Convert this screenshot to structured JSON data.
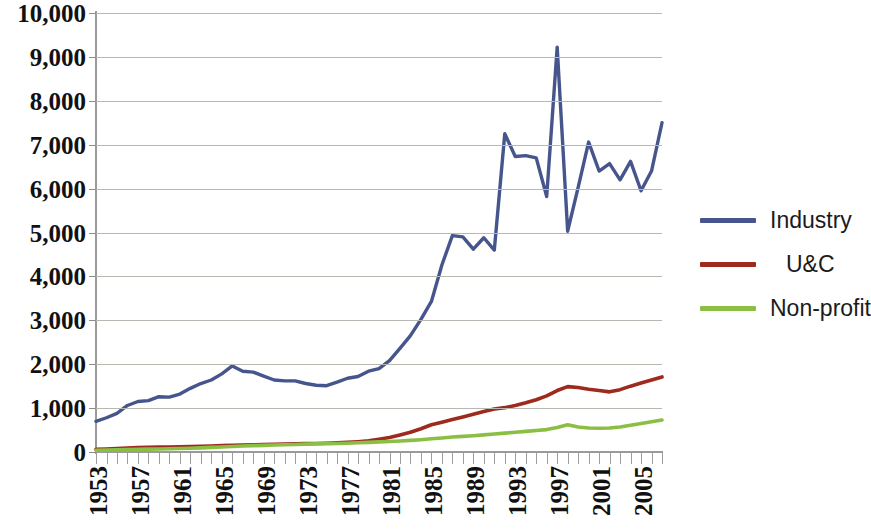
{
  "chart_data": {
    "type": "line",
    "title": "",
    "xlabel": "",
    "ylabel": "",
    "ylim": [
      0,
      10000
    ],
    "xlim": [
      1953,
      2007
    ],
    "grid": true,
    "legend_position": "right",
    "y_ticks": [
      10000,
      9000,
      8000,
      7000,
      6000,
      5000,
      4000,
      3000,
      2000,
      1000,
      0
    ],
    "y_tick_labels": [
      "10,000",
      "9,000",
      "8,000",
      "7,000",
      "6,000",
      "5,000",
      "4,000",
      "3,000",
      "2,000",
      "1,000",
      "0"
    ],
    "x_tick_labels": [
      "1953",
      "1957",
      "1961",
      "1965",
      "1969",
      "1973",
      "1977",
      "1981",
      "1985",
      "1989",
      "1993",
      "1997",
      "2001",
      "2005"
    ],
    "x": [
      1953,
      1954,
      1955,
      1956,
      1957,
      1958,
      1959,
      1960,
      1961,
      1962,
      1963,
      1964,
      1965,
      1966,
      1967,
      1968,
      1969,
      1970,
      1971,
      1972,
      1973,
      1974,
      1975,
      1976,
      1977,
      1978,
      1979,
      1980,
      1981,
      1982,
      1983,
      1984,
      1985,
      1986,
      1987,
      1988,
      1989,
      1990,
      1991,
      1992,
      1993,
      1994,
      1995,
      1996,
      1997,
      1998,
      1999,
      2000,
      2001,
      2002,
      2003,
      2004,
      2005,
      2006,
      2007
    ],
    "series": [
      {
        "name": "Industry",
        "color": "#46558c",
        "values": [
          700,
          780,
          880,
          1060,
          1150,
          1170,
          1260,
          1250,
          1320,
          1450,
          1560,
          1640,
          1780,
          1960,
          1840,
          1820,
          1730,
          1640,
          1620,
          1620,
          1560,
          1520,
          1510,
          1590,
          1680,
          1720,
          1840,
          1900,
          2080,
          2360,
          2650,
          3020,
          3430,
          4260,
          4930,
          4900,
          4620,
          4880,
          4600,
          7250,
          6730,
          6750,
          6700,
          5820,
          9220,
          5030,
          6030,
          7060,
          6400,
          6570,
          6200,
          6620,
          5950,
          6400,
          7500
        ]
      },
      {
        "name": "U&C",
        "color": "#9e2a1e",
        "values": [
          60,
          70,
          80,
          90,
          100,
          105,
          110,
          115,
          120,
          125,
          130,
          135,
          145,
          155,
          160,
          165,
          170,
          175,
          180,
          185,
          190,
          195,
          200,
          210,
          220,
          235,
          255,
          290,
          330,
          390,
          450,
          530,
          620,
          680,
          740,
          800,
          860,
          920,
          980,
          1010,
          1060,
          1120,
          1190,
          1280,
          1400,
          1490,
          1470,
          1430,
          1400,
          1370,
          1420,
          1500,
          1570,
          1640,
          1710
        ]
      },
      {
        "name": "Non-profit",
        "color": "#8bbf44",
        "values": [
          40,
          45,
          50,
          55,
          60,
          65,
          70,
          75,
          80,
          85,
          95,
          105,
          115,
          125,
          135,
          145,
          150,
          160,
          165,
          170,
          180,
          185,
          190,
          195,
          200,
          210,
          220,
          230,
          240,
          250,
          265,
          280,
          300,
          320,
          340,
          355,
          370,
          390,
          410,
          430,
          450,
          470,
          490,
          510,
          560,
          620,
          570,
          545,
          540,
          545,
          570,
          610,
          650,
          690,
          730
        ]
      }
    ]
  },
  "legend": {
    "items": [
      {
        "label": "Industry",
        "color": "#46558c"
      },
      {
        "label": "U&C",
        "color": "#9e2a1e"
      },
      {
        "label": "Non-profit",
        "color": "#8bbf44"
      }
    ]
  }
}
